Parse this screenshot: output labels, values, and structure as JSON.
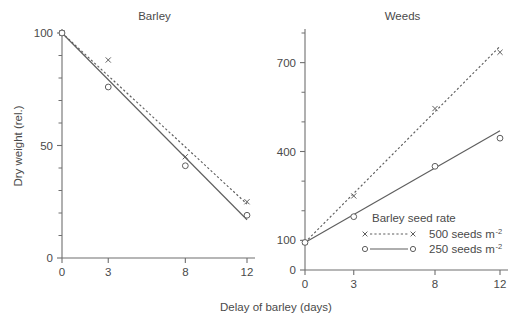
{
  "figure": {
    "xlabel": "Delay of barley (days)",
    "ylabel": "Dry weight (rel.)"
  },
  "legend": {
    "title": "Barley seed rate",
    "entries": [
      {
        "label": "500 seeds m",
        "sup": "-2",
        "marker": "cross",
        "line": "dashed"
      },
      {
        "label": "250 seeds m",
        "sup": "-2",
        "marker": "circle",
        "line": "solid"
      }
    ]
  },
  "colors": {
    "ink": "#5e5e5e",
    "axis": "#6f6f6f",
    "text": "#4a4a4a",
    "background": "#ffffff"
  },
  "chart_data": [
    {
      "type": "line",
      "title": "Barley",
      "xlabel": "Delay of barley (days)",
      "ylabel": "Dry weight (rel.)",
      "x": [
        0,
        3,
        8,
        12
      ],
      "xticks": [
        0,
        3,
        8,
        12
      ],
      "xticklabels": [
        "0",
        "3",
        "8",
        "12"
      ],
      "xlim": [
        0,
        12
      ],
      "yticks": [
        0,
        50,
        100
      ],
      "yticklabels": [
        "0",
        "50",
        "100"
      ],
      "yminor_step": 10,
      "ylim": [
        0,
        100
      ],
      "grid": false,
      "legend_position": "lower-right-of-second-panel",
      "series": [
        {
          "name": "500 seeds m-2",
          "marker": "cross",
          "line": "dashed",
          "values": [
            100,
            88,
            45,
            25
          ],
          "fit_line": {
            "x": [
              0,
              12
            ],
            "y": [
              100,
              24
            ]
          }
        },
        {
          "name": "250 seeds m-2",
          "marker": "circle",
          "line": "solid",
          "values": [
            100,
            76,
            41,
            19
          ],
          "fit_line": {
            "x": [
              0,
              12
            ],
            "y": [
              100,
              17
            ]
          }
        }
      ]
    },
    {
      "type": "line",
      "title": "Weeds",
      "xlabel": "Delay of barley (days)",
      "ylabel": "Dry weight (rel.)",
      "x": [
        0,
        3,
        8,
        12
      ],
      "xticks": [
        0,
        3,
        8,
        12
      ],
      "xticklabels": [
        "0",
        "3",
        "8",
        "12"
      ],
      "xlim": [
        0,
        12
      ],
      "yticks": [
        0,
        100,
        400,
        700
      ],
      "yticklabels": [
        "0",
        "100",
        "400",
        "700"
      ],
      "yminor_step": 100,
      "ylim": [
        0,
        800
      ],
      "grid": false,
      "series": [
        {
          "name": "500 seeds m-2",
          "marker": "cross",
          "line": "dashed",
          "values": [
            93,
            250,
            545,
            735
          ],
          "fit_line": {
            "x": [
              0,
              12
            ],
            "y": [
              93,
              755
            ]
          }
        },
        {
          "name": "250 seeds m-2",
          "marker": "circle",
          "line": "solid",
          "values": [
            93,
            180,
            350,
            445
          ],
          "fit_line": {
            "x": [
              0,
              12
            ],
            "y": [
              93,
              470
            ]
          }
        }
      ]
    }
  ]
}
